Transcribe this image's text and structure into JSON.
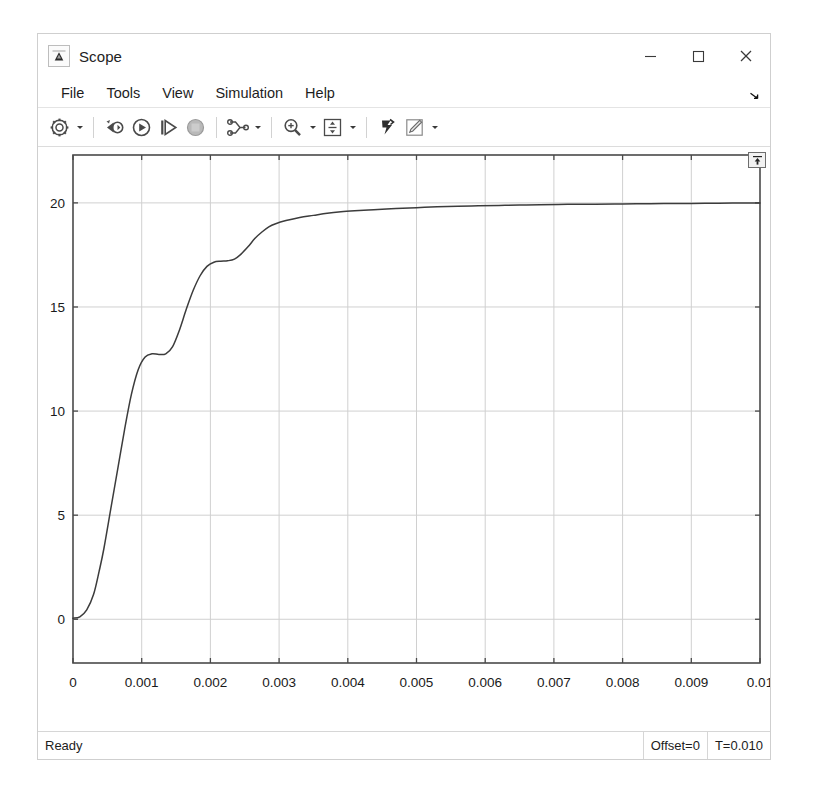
{
  "window": {
    "title": "Scope",
    "app_icon": "scope-icon",
    "controls": [
      {
        "name": "minimize-button",
        "glyph": "minimize-icon"
      },
      {
        "name": "maximize-button",
        "glyph": "maximize-icon"
      },
      {
        "name": "close-button",
        "glyph": "close-icon"
      }
    ]
  },
  "menubar": {
    "items": [
      {
        "label": "File"
      },
      {
        "label": "Tools"
      },
      {
        "label": "View"
      },
      {
        "label": "Simulation"
      },
      {
        "label": "Help"
      }
    ],
    "collapse_icon": "collapse-arrow-icon"
  },
  "toolbar": {
    "groups": [
      {
        "buttons": [
          {
            "name": "configuration-properties-button",
            "icon": "gear-icon",
            "has_caret": true
          }
        ]
      },
      {
        "buttons": [
          {
            "name": "run-back-to-start-button",
            "icon": "rewind-icon",
            "has_caret": false
          },
          {
            "name": "run-button",
            "icon": "play-icon",
            "has_caret": false
          },
          {
            "name": "step-forward-button",
            "icon": "step-forward-icon",
            "has_caret": false
          },
          {
            "name": "stop-button",
            "icon": "stop-icon",
            "has_caret": false
          }
        ]
      },
      {
        "buttons": [
          {
            "name": "simulink-highlight-button",
            "icon": "signal-selector-icon",
            "has_caret": true
          }
        ]
      },
      {
        "buttons": [
          {
            "name": "zoom-in-button",
            "icon": "zoom-in-icon",
            "has_caret": true
          },
          {
            "name": "autoscale-button",
            "icon": "autoscale-icon",
            "has_caret": true
          }
        ]
      },
      {
        "buttons": [
          {
            "name": "cursor-measurements-button",
            "icon": "cursor-measure-icon",
            "has_caret": false
          },
          {
            "name": "style-button",
            "icon": "pencil-style-icon",
            "has_caret": true
          }
        ]
      }
    ]
  },
  "plot": {
    "float_button": {
      "name": "float-signal-button",
      "icon": "up-arrow-icon"
    }
  },
  "statusbar": {
    "message": "Ready",
    "offset": "Offset=0",
    "time": "T=0.010"
  },
  "chart_data": {
    "type": "line",
    "title": "",
    "xlabel": "",
    "ylabel": "",
    "xlim": [
      0,
      0.01
    ],
    "ylim": [
      -2.1,
      22.3
    ],
    "grid": true,
    "legend": false,
    "xticks": [
      0,
      0.001,
      0.002,
      0.003,
      0.004,
      0.005,
      0.006,
      0.007,
      0.008,
      0.009,
      0.01
    ],
    "xticklabels": [
      "0",
      "0.001",
      "0.002",
      "0.003",
      "0.004",
      "0.005",
      "0.006",
      "0.007",
      "0.008",
      "0.009",
      "0.01"
    ],
    "yticks": [
      0,
      5,
      10,
      15,
      20
    ],
    "yticklabels": [
      "0",
      "5",
      "10",
      "15",
      "20"
    ],
    "line_color": "#3c3c3c",
    "series": [
      {
        "name": "signal",
        "x": [
          0,
          0.0001,
          0.0002,
          0.0003,
          0.00038,
          0.00045,
          0.00055,
          0.00065,
          0.00075,
          0.00085,
          0.00095,
          0.00105,
          0.00115,
          0.00125,
          0.00135,
          0.00145,
          0.00155,
          0.00165,
          0.00175,
          0.00185,
          0.00195,
          0.00205,
          0.00215,
          0.00225,
          0.00235,
          0.00245,
          0.00255,
          0.00265,
          0.00275,
          0.00285,
          0.00295,
          0.0031,
          0.0033,
          0.0035,
          0.0037,
          0.0039,
          0.0041,
          0.0043,
          0.0045,
          0.0047,
          0.005,
          0.0053,
          0.0056,
          0.0059,
          0.0062,
          0.0065,
          0.0068,
          0.0072,
          0.0076,
          0.008,
          0.0084,
          0.0088,
          0.0092,
          0.0096,
          0.01
        ],
        "y": [
          0.05,
          0.12,
          0.45,
          1.2,
          2.3,
          3.4,
          5.3,
          7.2,
          9.1,
          10.8,
          12.0,
          12.6,
          12.75,
          12.72,
          12.75,
          13.1,
          13.9,
          14.9,
          15.8,
          16.5,
          16.95,
          17.15,
          17.2,
          17.22,
          17.3,
          17.55,
          17.9,
          18.3,
          18.6,
          18.85,
          19.0,
          19.15,
          19.3,
          19.4,
          19.5,
          19.57,
          19.62,
          19.66,
          19.7,
          19.73,
          19.77,
          19.81,
          19.84,
          19.86,
          19.88,
          19.9,
          19.91,
          19.93,
          19.94,
          19.95,
          19.96,
          19.97,
          19.98,
          19.99,
          20.0
        ]
      }
    ]
  }
}
